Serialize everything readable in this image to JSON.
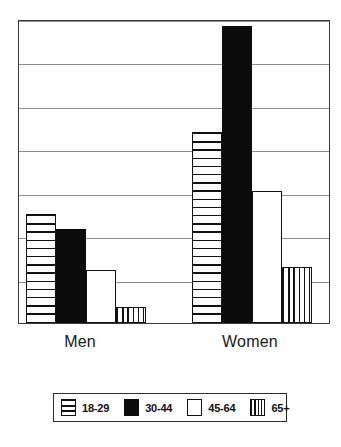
{
  "chart_data": {
    "type": "bar",
    "title": "",
    "subtitle": "",
    "xlabel": "",
    "ylabel": "",
    "categories": [
      "Men",
      "Women"
    ],
    "series": [
      {
        "name": "18-29",
        "pattern": "horizontal-lines",
        "color": "#ffffff",
        "values": [
          2.5,
          4.4
        ]
      },
      {
        "name": "30-44",
        "pattern": "solid-black",
        "color": "#000000",
        "values": [
          2.17,
          6.83
        ]
      },
      {
        "name": "45-64",
        "pattern": "white",
        "color": "#ffffff",
        "values": [
          1.22,
          3.05
        ]
      },
      {
        "name": "65+",
        "pattern": "vertical-lines",
        "color": "#ffffff",
        "values": [
          0.37,
          1.29
        ]
      }
    ],
    "ylim": [
      0,
      7
    ],
    "yticks": [
      0,
      1,
      2,
      3,
      4,
      5,
      6,
      7
    ],
    "ytick_labels": [
      "",
      "",
      "",
      "",
      "",
      "",
      "",
      ""
    ],
    "grid": true,
    "grid_axis": "y",
    "legend_position": "bottom",
    "axis_color": "#3a3a3a",
    "grid_color": "#8d8d8d",
    "bar_edge_color": "#111111"
  },
  "legend": {
    "items": [
      {
        "label": "18-29",
        "pattern": "fill-hlines"
      },
      {
        "label": "30-44",
        "pattern": "fill-solid"
      },
      {
        "label": "45-64",
        "pattern": "fill-white"
      },
      {
        "label": "65+",
        "pattern": "fill-vlines"
      }
    ]
  },
  "axis": {
    "category_labels": [
      "Men",
      "Women"
    ]
  }
}
